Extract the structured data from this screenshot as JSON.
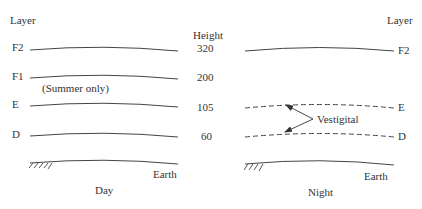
{
  "day_panel": {
    "header": "Layer",
    "caption": "Day",
    "layers": [
      {
        "name": "F2",
        "style": "solid"
      },
      {
        "name": "F1",
        "style": "solid",
        "note": "(Summer only)"
      },
      {
        "name": "E",
        "style": "solid"
      },
      {
        "name": "D",
        "style": "solid"
      }
    ],
    "ground_label": "Earth"
  },
  "height_column": {
    "header": "Height",
    "values": [
      "320",
      "200",
      "105",
      "60"
    ]
  },
  "night_panel": {
    "header": "Layer",
    "caption": "Night",
    "layers": [
      {
        "name": "F2",
        "style": "solid"
      },
      {
        "name": "E",
        "style": "dashed"
      },
      {
        "name": "D",
        "style": "dashed"
      }
    ],
    "annotation": "Vestigital",
    "ground_label": "Earth"
  },
  "colors": {
    "line": "#444444",
    "text": "#333333",
    "background": "#ffffff"
  }
}
